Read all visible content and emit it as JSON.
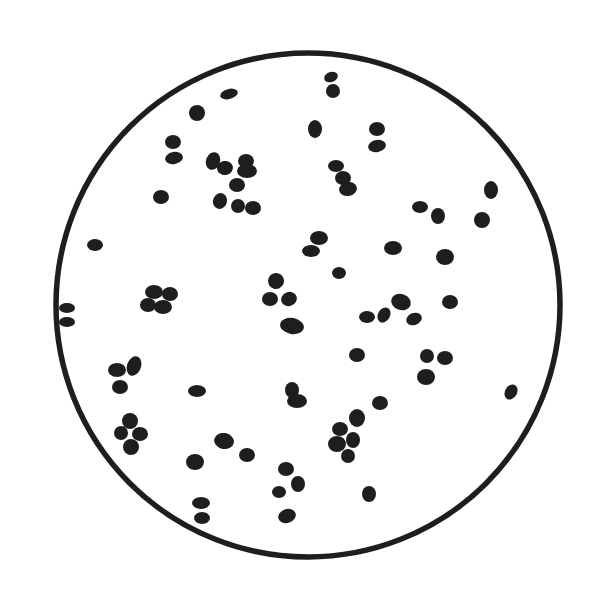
{
  "figure": {
    "background": "#ffffff",
    "ink": "#1e1e1e",
    "field": {
      "cx": 308,
      "cy": 305,
      "r": 252,
      "stroke_width": 5.5
    },
    "cells": [
      [
        229,
        94,
        9,
        5,
        -15
      ],
      [
        197,
        113,
        8,
        8,
        0
      ],
      [
        331,
        77,
        7,
        5,
        -20
      ],
      [
        333,
        91,
        7,
        7,
        0
      ],
      [
        173,
        142,
        8,
        7,
        0
      ],
      [
        174,
        158,
        9,
        6,
        -10
      ],
      [
        213,
        161,
        7,
        9,
        20
      ],
      [
        225,
        168,
        8,
        7,
        -10
      ],
      [
        246,
        161,
        8,
        7,
        0
      ],
      [
        247,
        171,
        10,
        7,
        0
      ],
      [
        237,
        185,
        8,
        7,
        0
      ],
      [
        220,
        201,
        7,
        8,
        20
      ],
      [
        238,
        206,
        7,
        7,
        0
      ],
      [
        253,
        208,
        8,
        7,
        0
      ],
      [
        161,
        197,
        8,
        7,
        0
      ],
      [
        95,
        245,
        8,
        6,
        0
      ],
      [
        315,
        129,
        7,
        9,
        0
      ],
      [
        377,
        129,
        8,
        7,
        0
      ],
      [
        377,
        146,
        9,
        6,
        -10
      ],
      [
        336,
        166,
        8,
        6,
        0
      ],
      [
        343,
        178,
        8,
        7,
        0
      ],
      [
        348,
        189,
        9,
        7,
        -10
      ],
      [
        491,
        190,
        7,
        9,
        0
      ],
      [
        420,
        207,
        8,
        6,
        0
      ],
      [
        438,
        216,
        7,
        8,
        0
      ],
      [
        482,
        220,
        8,
        8,
        0
      ],
      [
        319,
        238,
        9,
        7,
        0
      ],
      [
        311,
        251,
        9,
        6,
        0
      ],
      [
        393,
        248,
        9,
        7,
        0
      ],
      [
        445,
        257,
        9,
        8,
        0
      ],
      [
        339,
        273,
        7,
        6,
        0
      ],
      [
        276,
        281,
        8,
        8,
        20
      ],
      [
        270,
        299,
        8,
        7,
        0
      ],
      [
        289,
        299,
        8,
        7,
        -20
      ],
      [
        292,
        326,
        12,
        8,
        10
      ],
      [
        154,
        292,
        9,
        7,
        0
      ],
      [
        170,
        294,
        8,
        7,
        0
      ],
      [
        148,
        305,
        8,
        7,
        0
      ],
      [
        163,
        307,
        9,
        7,
        0
      ],
      [
        67,
        308,
        8,
        5,
        0
      ],
      [
        67,
        322,
        8,
        5,
        0
      ],
      [
        367,
        317,
        8,
        6,
        0
      ],
      [
        384,
        315,
        6,
        8,
        30
      ],
      [
        401,
        302,
        10,
        8,
        20
      ],
      [
        414,
        319,
        8,
        6,
        -20
      ],
      [
        450,
        302,
        8,
        7,
        0
      ],
      [
        357,
        355,
        8,
        7,
        0
      ],
      [
        427,
        356,
        7,
        7,
        0
      ],
      [
        445,
        358,
        8,
        7,
        0
      ],
      [
        426,
        377,
        9,
        8,
        0
      ],
      [
        117,
        370,
        9,
        7,
        0
      ],
      [
        134,
        366,
        7,
        10,
        20
      ],
      [
        120,
        387,
        8,
        7,
        0
      ],
      [
        197,
        391,
        9,
        6,
        0
      ],
      [
        292,
        390,
        7,
        8,
        0
      ],
      [
        297,
        401,
        10,
        7,
        0
      ],
      [
        130,
        421,
        8,
        8,
        0
      ],
      [
        121,
        433,
        7,
        7,
        0
      ],
      [
        140,
        434,
        8,
        7,
        0
      ],
      [
        131,
        447,
        8,
        8,
        0
      ],
      [
        380,
        403,
        8,
        7,
        0
      ],
      [
        357,
        418,
        8,
        9,
        0
      ],
      [
        340,
        429,
        8,
        7,
        0
      ],
      [
        353,
        440,
        7,
        8,
        0
      ],
      [
        337,
        444,
        9,
        8,
        0
      ],
      [
        348,
        456,
        7,
        7,
        0
      ],
      [
        511,
        392,
        6,
        8,
        30
      ],
      [
        224,
        441,
        10,
        8,
        10
      ],
      [
        247,
        455,
        8,
        7,
        0
      ],
      [
        195,
        462,
        9,
        8,
        0
      ],
      [
        286,
        469,
        8,
        7,
        0
      ],
      [
        298,
        484,
        7,
        8,
        0
      ],
      [
        279,
        492,
        7,
        6,
        0
      ],
      [
        369,
        494,
        7,
        8,
        0
      ],
      [
        201,
        503,
        9,
        6,
        0
      ],
      [
        202,
        518,
        8,
        6,
        0
      ],
      [
        287,
        516,
        9,
        7,
        -20
      ]
    ]
  }
}
